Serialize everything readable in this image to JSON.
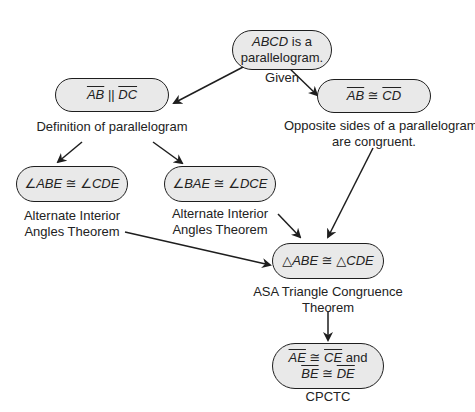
{
  "diagram": {
    "type": "flow_proof",
    "nodes": [
      {
        "id": "given",
        "statement": "ABCD is a parallelogram.",
        "statement_parts": {
          "italic": "ABCD",
          "rest_line1": " is a",
          "line2": "parallelogram."
        },
        "reason": "Given"
      },
      {
        "id": "ab-parallel-dc",
        "statement": "AB ∥ DC",
        "seg1": "AB",
        "rel": "||",
        "seg2": "DC",
        "reason": "Definition of parallelogram"
      },
      {
        "id": "ab-congruent-cd",
        "statement": "AB ≅ CD",
        "seg1": "AB",
        "rel": "≅",
        "seg2": "CD",
        "reason_line1": "Opposite sides of a parallelogram",
        "reason_line2": "are congruent."
      },
      {
        "id": "angle-abe-cde",
        "statement": "∠ABE ≅ ∠CDE",
        "reason_line1": "Alternate Interior",
        "reason_line2": "Angles Theorem"
      },
      {
        "id": "angle-bae-dce",
        "statement": "∠BAE ≅ ∠DCE",
        "reason_line1": "Alternate Interior",
        "reason_line2": "Angles Theorem"
      },
      {
        "id": "triangles-congruent",
        "statement": "△ABE ≅ △CDE",
        "reason_line1": "ASA Triangle Congruence",
        "reason_line2": "Theorem"
      },
      {
        "id": "cpctc",
        "line1_seg1": "AE",
        "line1_rel": "≅",
        "line1_seg2": "CE",
        "line1_tail": " and",
        "line2_seg1": "BE",
        "line2_rel": "≅",
        "line2_seg2": "DE",
        "reason": "CPCTC"
      }
    ],
    "edges": [
      {
        "from": "given",
        "to": "ab-parallel-dc"
      },
      {
        "from": "given",
        "to": "ab-congruent-cd"
      },
      {
        "from": "ab-parallel-dc",
        "to": "angle-abe-cde"
      },
      {
        "from": "ab-parallel-dc",
        "to": "angle-bae-dce"
      },
      {
        "from": "angle-abe-cde",
        "to": "triangles-congruent"
      },
      {
        "from": "angle-bae-dce",
        "to": "triangles-congruent"
      },
      {
        "from": "ab-congruent-cd",
        "to": "triangles-congruent"
      },
      {
        "from": "triangles-congruent",
        "to": "cpctc"
      }
    ],
    "colors": {
      "box_fill": "#e9e9e9",
      "stroke": "#1e1e1e",
      "text": "#222222"
    }
  }
}
